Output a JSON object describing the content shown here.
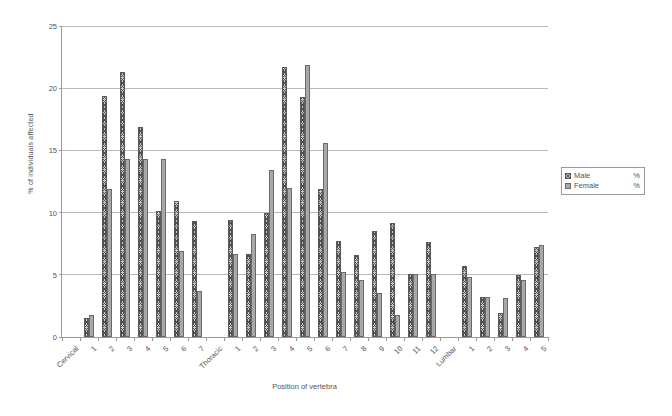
{
  "chart_data": {
    "type": "bar",
    "title": "",
    "xlabel": "Position of vertebra",
    "ylabel": "% of individuals affected",
    "ylim": [
      0,
      25
    ],
    "ytick_step": 5,
    "yticks": [
      0,
      5,
      10,
      15,
      20,
      25
    ],
    "grid": "horizontal",
    "legend_position": "right",
    "legend": [
      {
        "name": "Male",
        "unit": "%",
        "pattern": "cross-hatch",
        "color": "#c9c9c9"
      },
      {
        "name": "Female",
        "unit": "%",
        "pattern": "solid",
        "color": "#a8a8a8"
      }
    ],
    "series": [
      {
        "name": "Male",
        "unit": "%",
        "values": [
          null,
          1.5,
          19.4,
          21.3,
          16.9,
          10.1,
          10.9,
          9.3,
          null,
          9.4,
          6.7,
          10.0,
          21.7,
          19.3,
          11.9,
          7.7,
          6.6,
          8.5,
          9.2,
          5.1,
          7.6,
          null,
          5.7,
          3.2,
          1.9,
          5.0,
          7.2
        ]
      },
      {
        "name": "Female",
        "unit": "%",
        "values": [
          null,
          1.8,
          11.9,
          14.3,
          14.3,
          14.3,
          6.9,
          3.7,
          null,
          6.7,
          8.3,
          13.4,
          12.0,
          21.9,
          15.6,
          5.2,
          4.6,
          3.5,
          1.8,
          5.1,
          5.1,
          null,
          4.8,
          3.2,
          3.1,
          4.6,
          7.4
        ]
      }
    ],
    "categories": [
      "Cervical",
      "1",
      "2",
      "3",
      "4",
      "5",
      "6",
      "7",
      "Thoracic",
      "1",
      "2",
      "3",
      "4",
      "5",
      "6",
      "7",
      "8",
      "9",
      "10",
      "11",
      "12",
      "Lumbar",
      "1",
      "2",
      "3",
      "4",
      "5"
    ],
    "category_is_group": [
      true,
      false,
      false,
      false,
      false,
      false,
      false,
      false,
      true,
      false,
      false,
      false,
      false,
      false,
      false,
      false,
      false,
      false,
      false,
      false,
      false,
      true,
      false,
      false,
      false,
      false,
      false
    ]
  }
}
